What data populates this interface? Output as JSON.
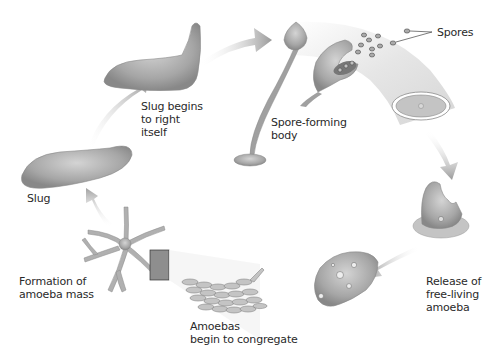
{
  "diagram": {
    "type": "life-cycle",
    "colors": {
      "organism": "#a8a8a8",
      "organism_dark": "#7e7e7e",
      "arrow": "#9a9a9a",
      "text": "#2a2a2a",
      "background": "#ffffff"
    },
    "stages": [
      {
        "id": "slug",
        "label": "Slug"
      },
      {
        "id": "slug-righting",
        "label": "Slug begins\nto right\nitself"
      },
      {
        "id": "spore-forming-body",
        "label": "Spore-forming\nbody"
      },
      {
        "id": "spores",
        "label": "Spores"
      },
      {
        "id": "release-amoeba",
        "label": "Release of\nfree-living\namoeba"
      },
      {
        "id": "amoebas-congregate",
        "label": "Amoebas\nbegin to congregate"
      },
      {
        "id": "amoeba-mass",
        "label": "Formation of\namoeba mass"
      }
    ]
  }
}
